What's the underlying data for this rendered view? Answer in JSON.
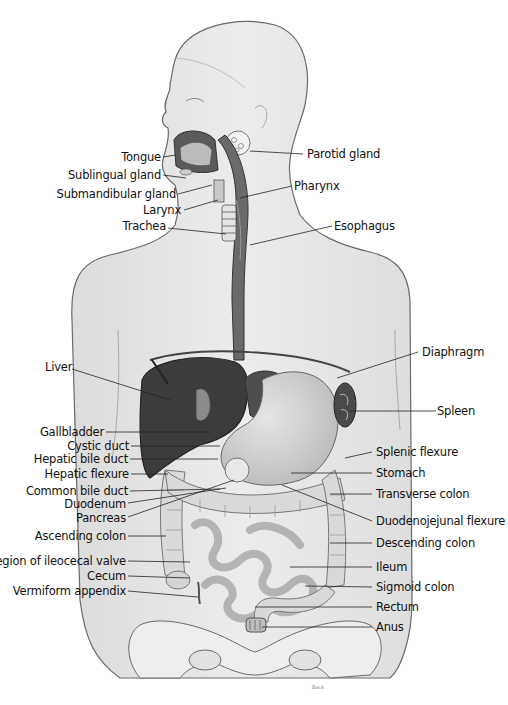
{
  "diagram": {
    "credit": "Back",
    "labels_left": [
      {
        "id": "tongue",
        "text": "Tongue"
      },
      {
        "id": "sublingual-gland",
        "text": "Sublingual gland"
      },
      {
        "id": "submandibular-gland",
        "text": "Submandibular gland"
      },
      {
        "id": "larynx",
        "text": "Larynx"
      },
      {
        "id": "trachea",
        "text": "Trachea"
      },
      {
        "id": "liver",
        "text": "Liver"
      },
      {
        "id": "gallbladder",
        "text": "Gallbladder"
      },
      {
        "id": "cystic-duct",
        "text": "Cystic duct"
      },
      {
        "id": "hepatic-bile-duct",
        "text": "Hepatic bile duct"
      },
      {
        "id": "hepatic-flexure",
        "text": "Hepatic flexure"
      },
      {
        "id": "common-bile-duct",
        "text": "Common bile duct"
      },
      {
        "id": "duodenum",
        "text": "Duodenum"
      },
      {
        "id": "pancreas",
        "text": "Pancreas"
      },
      {
        "id": "ascending-colon",
        "text": "Ascending colon"
      },
      {
        "id": "ileocecal-valve",
        "text": "Region of ileocecal valve"
      },
      {
        "id": "cecum",
        "text": "Cecum"
      },
      {
        "id": "vermiform-appendix",
        "text": "Vermiform appendix"
      }
    ],
    "labels_right": [
      {
        "id": "parotid-gland",
        "text": "Parotid gland"
      },
      {
        "id": "pharynx",
        "text": "Pharynx"
      },
      {
        "id": "esophagus",
        "text": "Esophagus"
      },
      {
        "id": "diaphragm",
        "text": "Diaphragm"
      },
      {
        "id": "spleen",
        "text": "Spleen"
      },
      {
        "id": "splenic-flexure",
        "text": "Splenic flexure"
      },
      {
        "id": "stomach",
        "text": "Stomach"
      },
      {
        "id": "transverse-colon",
        "text": "Transverse colon"
      },
      {
        "id": "duodenojejunal-flexure",
        "text": "Duodenojejunal flexure"
      },
      {
        "id": "descending-colon",
        "text": "Descending colon"
      },
      {
        "id": "ileum",
        "text": "Ileum"
      },
      {
        "id": "sigmoid-colon",
        "text": "Sigmoid colon"
      },
      {
        "id": "rectum",
        "text": "Rectum"
      },
      {
        "id": "anus",
        "text": "Anus"
      }
    ],
    "colors": {
      "skin": "#e9e9e9",
      "outline": "#555555",
      "liver": "#3a3a3a",
      "organ_dark": "#4a4a4a",
      "stomach": "#d6d6d6",
      "intestine": "#cfcfcf",
      "leader_line": "#222222"
    }
  }
}
